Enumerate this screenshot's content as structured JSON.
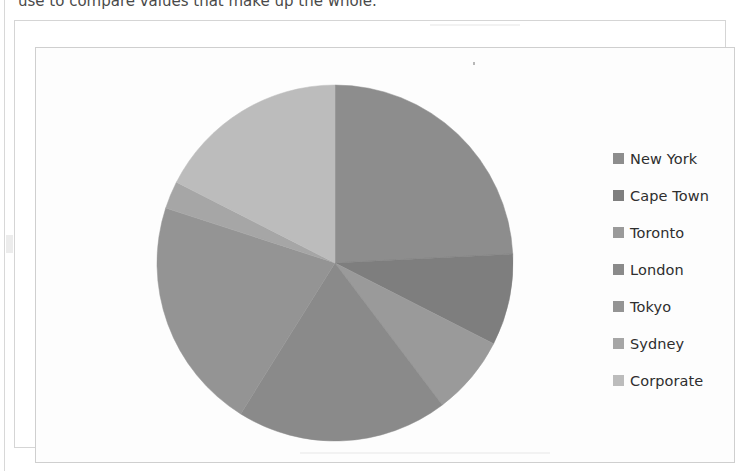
{
  "page": {
    "caption_clipped": "use to compare values that make up the whole."
  },
  "chart": {
    "title": "",
    "frame_label": "chart-object-frame",
    "background": "#ffffff",
    "legend": {
      "position": "right",
      "items": [
        {
          "label": "New York",
          "color": "#8d8d8d"
        },
        {
          "label": "Cape Town",
          "color": "#7e7e7e"
        },
        {
          "label": "Toronto",
          "color": "#9a9a9a"
        },
        {
          "label": "London",
          "color": "#8a8a8a"
        },
        {
          "label": "Tokyo",
          "color": "#949494"
        },
        {
          "label": "Sydney",
          "color": "#a6a6a6"
        },
        {
          "label": "Corporate",
          "color": "#bcbcbc"
        }
      ]
    }
  },
  "chart_data": {
    "type": "pie",
    "title": "",
    "xlabel": "",
    "ylabel": "",
    "start_angle_deg": 0,
    "direction": "clockwise",
    "grid": false,
    "legend_position": "right",
    "categories": [
      "New York",
      "Cape Town",
      "Toronto",
      "London",
      "Tokyo",
      "Sydney",
      "Corporate"
    ],
    "values": [
      24.2,
      8.3,
      7.2,
      19.2,
      21.1,
      2.5,
      17.5
    ],
    "units": "percent",
    "colors": [
      "#8d8d8d",
      "#7e7e7e",
      "#9a9a9a",
      "#8a8a8a",
      "#949494",
      "#a6a6a6",
      "#bcbcbc"
    ],
    "slice_angles_deg": [
      87.1,
      29.9,
      25.9,
      69.1,
      76.0,
      9.0,
      63.0
    ],
    "data_labels_shown": false
  }
}
